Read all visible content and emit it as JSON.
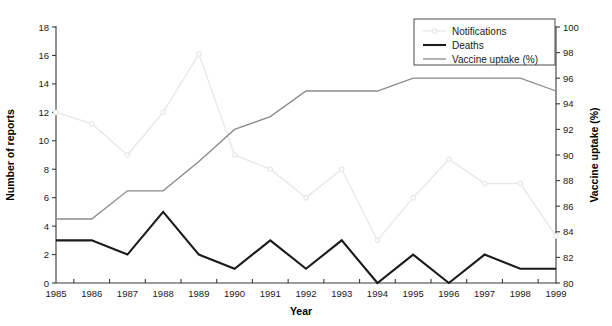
{
  "chart_data": {
    "type": "line",
    "title": "",
    "xlabel": "Year",
    "ylabel": "Number of reports",
    "y2label": "Vaccine uptake (%)",
    "categories": [
      "1985",
      "1986",
      "1987",
      "1988",
      "1989",
      "1990",
      "1991",
      "1992",
      "1993",
      "1994",
      "1995",
      "1996",
      "1997",
      "1998",
      "1999"
    ],
    "ylim": [
      0,
      18
    ],
    "yticks": [
      "0",
      "2",
      "4",
      "6",
      "8",
      "10",
      "12",
      "14",
      "16",
      "18"
    ],
    "y2lim": [
      80,
      100
    ],
    "y2ticks": [
      "80",
      "82",
      "84",
      "86",
      "88",
      "90",
      "92",
      "94",
      "96",
      "98",
      "100"
    ],
    "grid": false,
    "legend_position": "top-right",
    "series": [
      {
        "name": "Notifications",
        "axis": "left",
        "color": "#e8e8e8",
        "width": 1.4,
        "markers": true,
        "values": [
          12,
          11.2,
          9,
          12,
          16.1,
          9,
          8,
          6,
          8,
          3,
          6,
          8.7,
          7,
          7,
          3.3
        ]
      },
      {
        "name": "Deaths",
        "axis": "left",
        "color": "#1a1a1a",
        "width": 2.1,
        "markers": false,
        "values": [
          3,
          3,
          2,
          5,
          2,
          1,
          3,
          1,
          3,
          0,
          2,
          0,
          2,
          1,
          1
        ]
      },
      {
        "name": "Vaccine uptake (%)",
        "axis": "right",
        "color": "#8a8a8a",
        "width": 1.3,
        "markers": false,
        "values": [
          85,
          85,
          87.2,
          87.2,
          89.5,
          92,
          93,
          95,
          95,
          95,
          96,
          96,
          96,
          96,
          95
        ]
      }
    ]
  },
  "legend": {
    "entries": [
      {
        "label": "Notifications"
      },
      {
        "label": "Deaths"
      },
      {
        "label": "Vaccine uptake (%)"
      }
    ]
  }
}
